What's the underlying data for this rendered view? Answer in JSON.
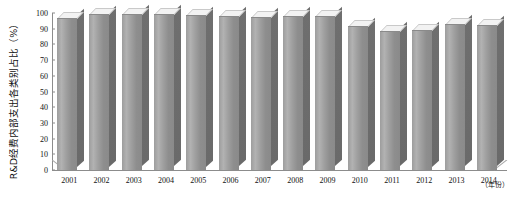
{
  "chart_data": {
    "type": "bar",
    "title": "",
    "subtitle": "",
    "xlabel": "(年份)",
    "ylabel": "R&D经费内部支出各类别占比（%）",
    "categories": [
      "2001",
      "2002",
      "2003",
      "2004",
      "2005",
      "2006",
      "2007",
      "2008",
      "2009",
      "2010",
      "2011",
      "2012",
      "2013",
      "2014"
    ],
    "values": [
      96.5,
      98.5,
      99.0,
      99.0,
      98.0,
      97.5,
      97.0,
      97.5,
      97.5,
      91.0,
      88.0,
      88.5,
      92.5,
      92.0
    ],
    "series": [
      {
        "name": "R&D经费内部支出各类别占比",
        "values": [
          96.5,
          98.5,
          99.0,
          99.0,
          98.0,
          97.5,
          97.0,
          97.5,
          97.5,
          91.0,
          88.0,
          88.5,
          92.5,
          92.0
        ]
      }
    ],
    "ylim": [
      0,
      100
    ],
    "ytick_labels": [
      "0",
      "10",
      "20",
      "30",
      "40",
      "50",
      "60",
      "70",
      "80",
      "90",
      "100"
    ],
    "ytick_values": [
      0,
      10,
      20,
      30,
      40,
      50,
      60,
      70,
      80,
      90,
      100
    ],
    "grid": false,
    "legend": false,
    "legend_position": "none",
    "three_d": true,
    "annotations": []
  },
  "axes": {
    "y_title": "R&D经费内部支出各类别占比（%）",
    "x_unit_label": "（年份）"
  },
  "colors": {
    "bar_front_light": "#b2b2b2",
    "bar_front_dark": "#8a8a8a",
    "bar_side": "#6f6f6f",
    "bar_top": "#f2f2f2",
    "axis": "#8c8c8c",
    "text": "#111111",
    "background": "#ffffff"
  }
}
